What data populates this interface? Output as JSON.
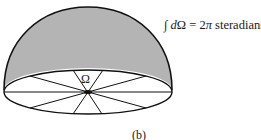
{
  "figure": {
    "formula": {
      "integral": "∫",
      "d": "d",
      "omega": "Ω",
      "equals": " = 2",
      "pi": "π",
      "unit": " steradians"
    },
    "center_label": "Ω",
    "caption": "(b)",
    "colors": {
      "dome_fill": "#b4b4b4",
      "line": "#111111",
      "base_fill": "#ffffff"
    },
    "shapes": {
      "dome": "hemisphere",
      "base": "ellipse",
      "spokes": 5
    }
  }
}
